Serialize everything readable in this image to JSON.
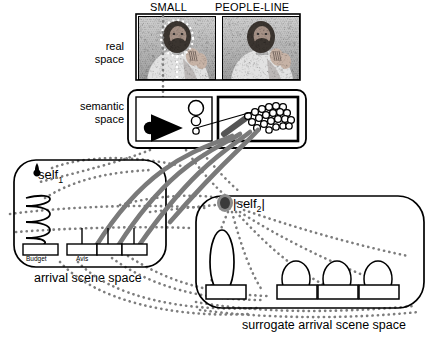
{
  "figure": {
    "title_hidden": "",
    "real_space_label": "real\nspace",
    "semantic_space_label": "semantic\nspace"
  },
  "top": {
    "panels": [
      {
        "id": "small",
        "label": "SMALL",
        "image_desc": "person-signing-photo",
        "annotation": "dotted-outline-around-head"
      },
      {
        "id": "people-line",
        "label": "PEOPLE-LINE",
        "image_desc": "person-signing-photo",
        "annotation": "none"
      }
    ]
  },
  "side_labels": {
    "real": "real",
    "real2": "space",
    "semantic": "semantic",
    "semantic2": "space"
  },
  "semantic_space": {
    "left_box": {
      "name": "small-icon",
      "desc": "dot-with-arrow-and-three-circles"
    },
    "right_box": {
      "name": "people-line-icon",
      "desc": "crowd-cluster-of-circles"
    }
  },
  "arrival_scene_space": {
    "caption": "arrival scene space",
    "self_label": "self",
    "self_sub": "1",
    "queue_desc": "zigzag-queue-line",
    "boxes": [
      {
        "id": "budget",
        "label": "Budget"
      },
      {
        "id": "avis",
        "label": "Avis"
      },
      {
        "id": "counter2",
        "label": ""
      },
      {
        "id": "counter3",
        "label": ""
      }
    ]
  },
  "surrogate_arrival_scene_space": {
    "caption": "surrogate arrival scene space",
    "self_label": "|self",
    "self_sub": "2",
    "self_label_end": "|",
    "big_ellipse": {
      "id": "long-line",
      "label": ""
    },
    "ellipses": [
      {
        "id": "small-line-1",
        "line1": "small",
        "line2": "line"
      },
      {
        "id": "small-line-2",
        "line1": "small",
        "line2": "line"
      },
      {
        "id": "small-line-3",
        "line1": "small",
        "line2": "line"
      }
    ],
    "boxes": [
      {
        "id": "budget-surrogate",
        "label": "|Budget|"
      },
      {
        "id": "avis-surrogate",
        "label": "|Avis|"
      },
      {
        "id": "counter2-surrogate",
        "label": ""
      },
      {
        "id": "counter3-surrogate",
        "label": ""
      }
    ]
  },
  "colors": {
    "ink": "#000000",
    "gray_link": "#707070",
    "dotted_link": "#7a7a7a",
    "photo_gray": "#909090"
  }
}
